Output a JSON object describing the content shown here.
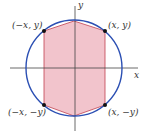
{
  "axes": {
    "x_label": "x",
    "y_label": "y"
  },
  "points": [
    {
      "label": "(−x, y)"
    },
    {
      "label": "(x, y)"
    },
    {
      "label": "(−x, −y)"
    },
    {
      "label": "(x, −y)"
    }
  ],
  "colors": {
    "circle": "#2b4fb3",
    "fill": "#f2c4cc",
    "edge": "#c0404f",
    "axis": "#444444",
    "dot": "#111111"
  }
}
